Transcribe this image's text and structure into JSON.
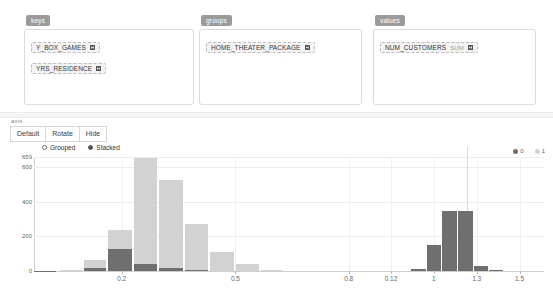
{
  "shelves": [
    {
      "name": "keys",
      "label": "keys",
      "pills": [
        {
          "field": "Y_BOX_GAMES",
          "agg": "",
          "remove": "remove"
        },
        {
          "field": "YRS_RESIDENCE",
          "agg": "",
          "remove": "remove"
        }
      ]
    },
    {
      "name": "groups",
      "label": "groups",
      "pills": [
        {
          "field": "HOME_THEATER_PACKAGE",
          "agg": "",
          "remove": "remove"
        }
      ]
    },
    {
      "name": "values",
      "label": "values",
      "pills": [
        {
          "field": "NUM_CUSTOMERS",
          "agg": "SUM",
          "remove": "remove"
        }
      ]
    }
  ],
  "toolbar": {
    "label": "axis",
    "buttons": [
      "Default",
      "Rotate",
      "Hide"
    ]
  },
  "mode": {
    "options": [
      "Grouped",
      "Stacked"
    ],
    "selected": "Stacked"
  },
  "chart_data": {
    "type": "bar",
    "title": "",
    "xlabel": "",
    "ylabel": "",
    "stacked": true,
    "grid": true,
    "legend_position": "top-right",
    "legend": [
      "0",
      "1"
    ],
    "colors": {
      "series_0": "#6f6f6f",
      "series_1": "#d2d2d2",
      "grid": "#ededed",
      "axis": "#cfcfcf"
    },
    "ylim": [
      0,
      659
    ],
    "yticks": [
      0,
      200,
      400,
      600,
      659
    ],
    "ytick_labels": [
      "0",
      "200",
      "400",
      "600",
      "659"
    ],
    "xtick_labels": [
      "0.2",
      "0.5",
      "0.8",
      "0.12",
      "1",
      "1.3",
      "1.5"
    ],
    "xtick_positions": [
      0.172,
      0.395,
      0.617,
      0.7,
      0.784,
      0.868,
      0.952
    ],
    "categories": [
      "b1",
      "b2",
      "b3",
      "b4",
      "b5",
      "b6",
      "b7",
      "b8",
      "b9",
      "b10",
      "b11",
      "b12",
      "b13",
      "b14",
      "b15",
      "b16",
      "b17",
      "b18"
    ],
    "series": [
      {
        "name": "0",
        "values": [
          2,
          6,
          16,
          126,
          38,
          16,
          6,
          0,
          0,
          0,
          0,
          0,
          12,
          148,
          345,
          345,
          28,
          3
        ]
      },
      {
        "name": "1",
        "values": [
          0,
          2,
          46,
          114,
          614,
          513,
          264,
          110,
          40,
          4,
          0,
          0,
          0,
          0,
          0,
          0,
          0,
          0
        ]
      }
    ],
    "bar_left_fraction": [
      0.0,
      0.05,
      0.098,
      0.146,
      0.196,
      0.246,
      0.296,
      0.346,
      0.396,
      0.446,
      0.494,
      0.7,
      0.74,
      0.77,
      0.8,
      0.831,
      0.862,
      0.893
    ],
    "bar_width_fraction": [
      0.044,
      0.044,
      0.044,
      0.046,
      0.046,
      0.046,
      0.046,
      0.046,
      0.046,
      0.04,
      0.03,
      0.03,
      0.028,
      0.028,
      0.029,
      0.029,
      0.029,
      0.026
    ]
  }
}
